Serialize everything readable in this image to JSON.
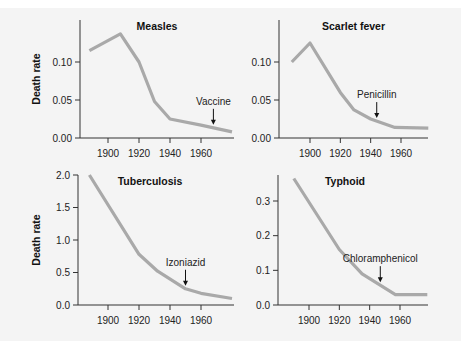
{
  "figure": {
    "ylabel": "Death rate"
  },
  "chart_data": [
    {
      "type": "line",
      "title": "Measles",
      "xlabel": "",
      "ylabel": "Death rate",
      "x_ticks": [
        1900,
        1920,
        1940,
        1960
      ],
      "y_ticks": [
        "0.00",
        "0.05",
        "0.10"
      ],
      "ylim": [
        0,
        0.14
      ],
      "x": [
        1888,
        1908,
        1920,
        1930,
        1940,
        1960,
        1980
      ],
      "values": [
        0.115,
        0.137,
        0.1,
        0.048,
        0.025,
        0.017,
        0.008
      ],
      "annotation": {
        "label": "Vaccine",
        "x": 1968
      },
      "panel": {
        "left": 80,
        "top": 20,
        "right": 234,
        "bottom": 138,
        "x0": 1900,
        "xpx0": 108,
        "x1": 1960,
        "xpx1": 201,
        "y0": 0,
        "ypx0": 138,
        "y1": 0.1,
        "ypx1": 62
      },
      "ylabel_shown": true
    },
    {
      "type": "line",
      "title": "Scarlet fever",
      "xlabel": "",
      "ylabel": "",
      "x_ticks": [
        1900,
        1920,
        1940,
        1960
      ],
      "y_ticks": [
        "0.00",
        "0.05",
        "0.10"
      ],
      "ylim": [
        0,
        0.14
      ],
      "x": [
        1888,
        1900,
        1920,
        1929,
        1940,
        1956,
        1978
      ],
      "values": [
        0.1,
        0.125,
        0.06,
        0.037,
        0.025,
        0.014,
        0.013
      ],
      "annotation": {
        "label": "Penicillin",
        "x": 1944
      },
      "panel": {
        "left": 279,
        "top": 20,
        "right": 428,
        "bottom": 138,
        "x0": 1900,
        "xpx0": 310,
        "x1": 1960,
        "xpx1": 401,
        "y0": 0,
        "ypx0": 138,
        "y1": 0.1,
        "ypx1": 62
      },
      "ylabel_shown": false
    },
    {
      "type": "line",
      "title": "Tuberculosis",
      "xlabel": "",
      "ylabel": "Death rate",
      "x_ticks": [
        1900,
        1920,
        1940,
        1960
      ],
      "y_ticks": [
        "0.0",
        "0.5",
        "1.0",
        "1.5",
        "2.0"
      ],
      "ylim": [
        0,
        2.0
      ],
      "x": [
        1888,
        1920,
        1932,
        1950,
        1960,
        1980
      ],
      "values": [
        2.0,
        0.78,
        0.52,
        0.25,
        0.18,
        0.1
      ],
      "annotation": {
        "label": "Izoniazid",
        "x": 1950
      },
      "panel": {
        "left": 78,
        "top": 175,
        "right": 234,
        "bottom": 305,
        "x0": 1900,
        "xpx0": 108,
        "x1": 1960,
        "xpx1": 201,
        "y0": 0,
        "ypx0": 305,
        "y1": 2.0,
        "ypx1": 175
      },
      "ylabel_shown": true
    },
    {
      "type": "line",
      "title": "Typhoid",
      "xlabel": "",
      "ylabel": "",
      "x_ticks": [
        1900,
        1920,
        1940,
        1960
      ],
      "y_ticks": [
        "0.0",
        "0.1",
        "0.2",
        "0.3"
      ],
      "ylim": [
        0,
        0.37
      ],
      "x": [
        1890,
        1920,
        1935,
        1957,
        1978
      ],
      "values": [
        0.365,
        0.16,
        0.09,
        0.03,
        0.03
      ],
      "annotation": {
        "label": "Chloramphenicol",
        "x": 1947
      },
      "panel": {
        "left": 278,
        "top": 175,
        "right": 428,
        "bottom": 305,
        "x0": 1900,
        "xpx0": 309,
        "x1": 1960,
        "xpx1": 400,
        "y0": 0,
        "ypx0": 305,
        "y1": 0.3,
        "ypx1": 201
      },
      "ylabel_shown": false
    }
  ]
}
